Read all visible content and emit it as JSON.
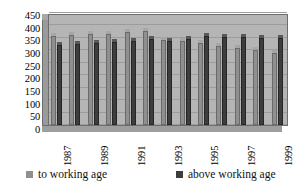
{
  "chart_data": {
    "type": "bar",
    "title": "",
    "xlabel": "",
    "ylabel": "",
    "ylim": [
      0,
      450
    ],
    "ytick_step": 50,
    "yticks": [
      "450",
      "400",
      "350",
      "300",
      "250",
      "200",
      "150",
      "100",
      "50",
      "0"
    ],
    "grid": true,
    "legend_position": "bottom",
    "categories": [
      "1987",
      "1988",
      "1989",
      "1990",
      "1991",
      "1992",
      "1993",
      "1994",
      "1995",
      "1996",
      "1997",
      "1998",
      "1999"
    ],
    "visible_tick_labels": [
      "1987",
      "1989",
      "1991",
      "1993",
      "1995",
      "1997",
      "1999"
    ],
    "series": [
      {
        "name": "to working age",
        "color": "#8f8f8f",
        "values": [
          395,
          398,
          402,
          405,
          410,
          415,
          378,
          371,
          365,
          353,
          345,
          333,
          320
        ]
      },
      {
        "name": "above working age",
        "color": "#3d3d3d",
        "values": [
          355,
          360,
          365,
          369,
          374,
          382,
          374,
          383,
          396,
          392,
          388,
          386,
          387
        ]
      }
    ]
  },
  "legend": {
    "items": [
      {
        "label": "to working age"
      },
      {
        "label": "above working age"
      }
    ]
  }
}
